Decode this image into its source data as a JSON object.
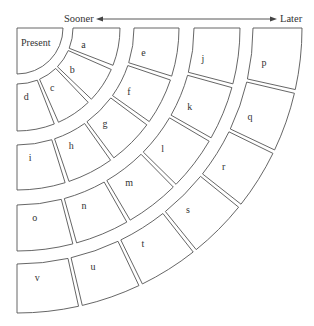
{
  "header": {
    "left_label": "Sooner",
    "right_label": "Later"
  },
  "geometry": {
    "center": [
      17,
      28
    ],
    "arrow": {
      "y": 19,
      "x1": 100,
      "x2": 273
    },
    "angular_gap_px": 3.5
  },
  "center_cell": {
    "label": "Present",
    "r": 46
  },
  "rings": [
    {
      "r_in": 56,
      "r_out": 103,
      "cells": [
        "a",
        "b",
        "c",
        "d"
      ]
    },
    {
      "r_in": 117,
      "r_out": 162,
      "cells": [
        "e",
        "f",
        "g",
        "h",
        "i"
      ]
    },
    {
      "r_in": 177,
      "r_out": 223,
      "cells": [
        "j",
        "k",
        "l",
        "m",
        "n",
        "o"
      ]
    },
    {
      "r_in": 236,
      "r_out": 285,
      "cells": [
        "p",
        "q",
        "r",
        "s",
        "t",
        "u",
        "v"
      ]
    }
  ],
  "colors": {
    "stroke": "#555555",
    "text": "#333333",
    "background": "#ffffff"
  }
}
